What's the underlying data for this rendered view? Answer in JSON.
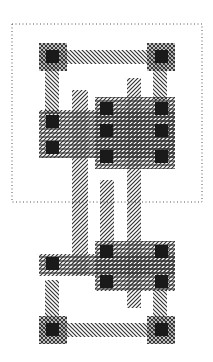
{
  "diagram": {
    "type": "vlsi-cell-layout",
    "colors": {
      "stroke": "#333333",
      "contact": "#1a1a1a",
      "boundary": "#555555",
      "background": "#ffffff"
    },
    "boundary": {
      "x": 12,
      "y": 24,
      "w": 190,
      "h": 178
    },
    "metal": [
      {
        "x": 39,
        "y": 50,
        "w": 136,
        "h": 14
      },
      {
        "x": 45,
        "y": 64,
        "w": 14,
        "h": 50
      },
      {
        "x": 153,
        "y": 64,
        "w": 14,
        "h": 36
      },
      {
        "x": 39,
        "y": 323,
        "w": 136,
        "h": 14
      },
      {
        "x": 45,
        "y": 280,
        "w": 14,
        "h": 50
      },
      {
        "x": 153,
        "y": 290,
        "w": 14,
        "h": 40
      }
    ],
    "poly": [
      {
        "x": 72,
        "y": 90,
        "w": 16,
        "h": 185
      },
      {
        "x": 100,
        "y": 180,
        "w": 14,
        "h": 65
      },
      {
        "x": 127,
        "y": 78,
        "w": 14,
        "h": 230
      }
    ],
    "diffusion": [
      {
        "x": 39,
        "y": 110,
        "w": 136,
        "h": 48
      },
      {
        "x": 95,
        "y": 97,
        "w": 80,
        "h": 72
      },
      {
        "x": 39,
        "y": 254,
        "w": 136,
        "h": 22
      },
      {
        "x": 95,
        "y": 241,
        "w": 80,
        "h": 50
      }
    ],
    "contact_pads": [
      {
        "x": 39,
        "y": 43,
        "w": 28,
        "h": 28
      },
      {
        "x": 147,
        "y": 43,
        "w": 28,
        "h": 28
      },
      {
        "x": 39,
        "y": 316,
        "w": 28,
        "h": 28
      },
      {
        "x": 147,
        "y": 316,
        "w": 28,
        "h": 28
      }
    ],
    "contacts": [
      {
        "x": 46,
        "y": 50
      },
      {
        "x": 155,
        "y": 50
      },
      {
        "x": 46,
        "y": 115
      },
      {
        "x": 46,
        "y": 141
      },
      {
        "x": 100,
        "y": 102
      },
      {
        "x": 100,
        "y": 124
      },
      {
        "x": 100,
        "y": 150
      },
      {
        "x": 155,
        "y": 102
      },
      {
        "x": 155,
        "y": 124
      },
      {
        "x": 155,
        "y": 150
      },
      {
        "x": 46,
        "y": 257
      },
      {
        "x": 100,
        "y": 245
      },
      {
        "x": 100,
        "y": 275
      },
      {
        "x": 155,
        "y": 245
      },
      {
        "x": 155,
        "y": 275
      },
      {
        "x": 46,
        "y": 323
      },
      {
        "x": 155,
        "y": 323
      }
    ],
    "contact_size": 13
  }
}
